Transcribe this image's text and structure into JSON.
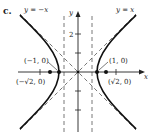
{
  "panel_label": "c.",
  "axes": {
    "x_label": "x",
    "y_label": "y",
    "y_tick_label": "2"
  },
  "asymptotes": {
    "left_label": "y = −x",
    "right_label": "y = x"
  },
  "vertices": {
    "left": "(−1, 0)",
    "right": "(1, 0)"
  },
  "foci": {
    "left": "(−√2, 0)",
    "right": "(√2, 0)"
  },
  "colors": {
    "curve": "#111111",
    "axis": "#222222",
    "dash": "#555555"
  }
}
